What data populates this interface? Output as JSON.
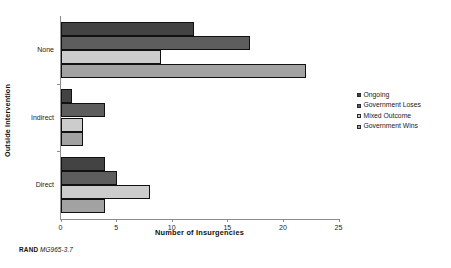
{
  "chart_data": {
    "type": "bar",
    "orientation": "horizontal",
    "title": "",
    "xlabel": "Number of Insurgencies",
    "ylabel": "Outside Intervention",
    "categories": [
      "None",
      "Indirect",
      "Direct"
    ],
    "series": [
      {
        "name": "Ongoing",
        "color": "#434343",
        "values": [
          12,
          1,
          4
        ]
      },
      {
        "name": "Government Loses",
        "color": "#5d5d5d",
        "values": [
          17,
          4,
          5
        ]
      },
      {
        "name": "Mixed Outcome",
        "color": "#cccccc",
        "values": [
          9,
          2,
          8
        ]
      },
      {
        "name": "Government Wins",
        "color": "#a2a2a2",
        "values": [
          22,
          2,
          4
        ]
      }
    ],
    "xlim": [
      0,
      25
    ],
    "xticks": [
      0,
      5,
      10,
      15,
      20,
      25
    ],
    "xtick_labels": [
      "0",
      "5",
      "10",
      "15",
      "20",
      "25"
    ],
    "grid": false,
    "legend_position": "right"
  },
  "legend": {
    "items": [
      {
        "label": "Ongoing"
      },
      {
        "label": "Government Loses"
      },
      {
        "label": "Mixed Outcome"
      },
      {
        "label": "Government Wins"
      }
    ]
  },
  "footer": {
    "publisher": "RAND",
    "figure_code": "MG965-3.7"
  }
}
